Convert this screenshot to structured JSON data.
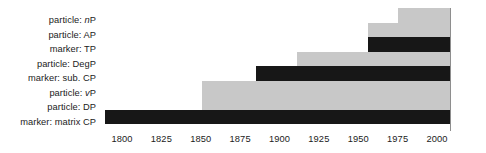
{
  "chart_data": {
    "type": "bar",
    "orientation": "horizontal",
    "title": "",
    "xlabel": "",
    "ylabel": "",
    "xlim": [
      1783,
      2008
    ],
    "grid": false,
    "legend": false,
    "axis": {
      "tick_labels": [
        "1800",
        "1825",
        "1850",
        "1875",
        "1900",
        "1925",
        "1950",
        "1975",
        "2000"
      ],
      "tick_values": [
        1800,
        1825,
        1850,
        1875,
        1900,
        1925,
        1950,
        1975,
        2000
      ],
      "spine": "right"
    },
    "colors": {
      "gray": "#c8c8c8",
      "black": "#171717",
      "spine": "#8e8e8e",
      "text": "#1b1b1b",
      "background": "#ffffff"
    },
    "categories": [
      "particle: nP",
      "particle: AP",
      "marker: TP",
      "particle: DegP",
      "marker: sub. CP",
      "particle: vP",
      "particle: DP",
      "marker: matrix CP"
    ],
    "bars": [
      {
        "label_prefix": "particle:",
        "label_italic": "n",
        "label_suffix": "P",
        "label": "particle: nP",
        "start": 1975,
        "end": 2008,
        "color": "gray",
        "row": 0
      },
      {
        "label_prefix": "particle:",
        "label_italic": "",
        "label_suffix": "AP",
        "label": "particle: AP",
        "start": 1956,
        "end": 2008,
        "color": "gray",
        "row": 1
      },
      {
        "label_prefix": "marker:",
        "label_italic": "",
        "label_suffix": "TP",
        "label": "marker: TP",
        "start": 1956,
        "end": 2008,
        "color": "black",
        "row": 2
      },
      {
        "label_prefix": "particle:",
        "label_italic": "",
        "label_suffix": "DegP",
        "label": "particle: DegP",
        "start": 1911,
        "end": 2008,
        "color": "gray",
        "row": 3
      },
      {
        "label_prefix": "marker:",
        "label_italic": "",
        "label_suffix": "sub. CP",
        "label": "marker: sub. CP",
        "start": 1885,
        "end": 2008,
        "color": "black",
        "row": 4
      },
      {
        "label_prefix": "particle:",
        "label_italic": "v",
        "label_suffix": "P",
        "label": "particle: vP",
        "start": 1851,
        "end": 2008,
        "color": "gray",
        "row": 5
      },
      {
        "label_prefix": "particle:",
        "label_italic": "",
        "label_suffix": "DP",
        "label": "particle: DP",
        "start": 1851,
        "end": 2008,
        "color": "gray",
        "row": 6
      },
      {
        "label_prefix": "marker:",
        "label_italic": "",
        "label_suffix": "matrix CP",
        "label": "marker: matrix CP",
        "start": 1789,
        "end": 2008,
        "color": "black",
        "row": 7
      }
    ]
  }
}
